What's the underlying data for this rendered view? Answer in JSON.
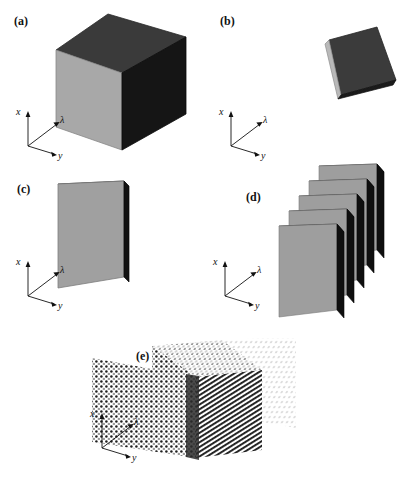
{
  "figure": {
    "background_color": "#ffffff",
    "panel_count": 5,
    "axis_labels": {
      "x": "x",
      "lambda": "λ",
      "y": "y"
    },
    "colors": {
      "face_light_gray": "#a8a8a8",
      "face_mid_gray": "#8f8f8f",
      "face_dark_gray": "#3a3a3a",
      "face_near_black": "#151515",
      "edge_black": "#000000",
      "outline": "#000000",
      "dot_dark": "#1a1a1a",
      "dot_light": "#d8d8d8"
    },
    "panels": [
      {
        "id": "a",
        "label": "(a)",
        "caption_text": "(a)",
        "shape": "full-data-cube",
        "slab_count": 1,
        "description": "solid cube with light-gray front face, dark-gray top face and near-black right face"
      },
      {
        "id": "b",
        "label": "(b)",
        "caption_text": "(b)",
        "shape": "horizontal-slab",
        "slab_count": 1,
        "description": "thin horizontal dark slab, one spectral plane"
      },
      {
        "id": "c",
        "label": "(c)",
        "caption_text": "(c)",
        "shape": "vertical-slab",
        "slab_count": 1,
        "description": "single vertical gray slab with dark top and right edges"
      },
      {
        "id": "d",
        "label": "(d)",
        "caption_text": "(d)",
        "shape": "stacked-vertical-slabs",
        "slab_count": 5,
        "description": "five stacked vertical gray slabs separated by black edges"
      },
      {
        "id": "e",
        "label": "(e)",
        "caption_text": "(e)",
        "shape": "voxel-dot-matrix-cube",
        "slab_count": 1,
        "description": "data cube rendered as a matrix of discrete voxel dots"
      }
    ]
  }
}
